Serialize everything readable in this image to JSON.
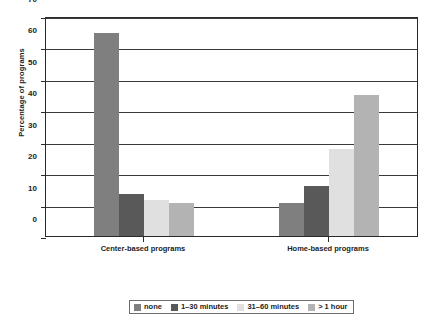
{
  "chart_data": {
    "type": "bar",
    "title": "",
    "xlabel": "",
    "ylabel": "Percentage of programs",
    "categories": [
      "Center-based programs",
      "Home-based programs"
    ],
    "series": [
      {
        "name": "none",
        "values": [
          64.5,
          10.5
        ],
        "color": "#7f7f7f"
      },
      {
        "name": "1–30 minutes",
        "values": [
          13.3,
          16.0
        ],
        "color": "#595959"
      },
      {
        "name": "31–60 minutes",
        "values": [
          11.5,
          27.7
        ],
        "color": "#e0e0e0"
      },
      {
        "name": "> 1 hour",
        "values": [
          10.5,
          45.0
        ],
        "color": "#b3b3b3"
      }
    ],
    "ylim": [
      0,
      70
    ],
    "yticks": [
      0,
      10,
      20,
      30,
      40,
      50,
      60,
      70
    ],
    "ytick_labels": [
      "0",
      "10",
      "20",
      "30",
      "40",
      "50",
      "60",
      "70"
    ],
    "grid": true,
    "legend_position": "bottom"
  }
}
